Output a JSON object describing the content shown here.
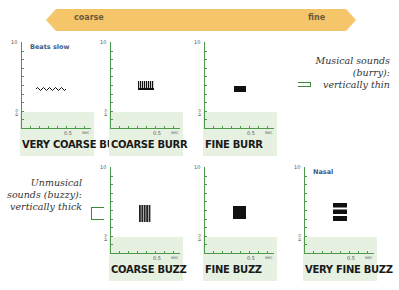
{
  "scale_arrow": {
    "left_label": "coarse",
    "right_label": "fine",
    "color": "#f5c56a"
  },
  "panels": [
    {
      "title": "VERY COARSE BURR",
      "subtitle": "Beats slow",
      "y_top": "10",
      "y_unit": "kHz",
      "x_tick": "0.5",
      "x_unit": "sec",
      "glyph": "wave"
    },
    {
      "title": "COARSE BURR",
      "subtitle": "",
      "y_top": "10",
      "y_unit": "kHz",
      "x_tick": "0.5",
      "x_unit": "sec",
      "glyph": "comb"
    },
    {
      "title": "FINE BURR",
      "subtitle": "",
      "y_top": "10",
      "y_unit": "kHz",
      "x_tick": "0.5",
      "x_unit": "sec",
      "glyph": "bar-thin"
    },
    {
      "title": "COARSE BUZZ",
      "subtitle": "",
      "y_top": "10",
      "y_unit": "kHz",
      "x_tick": "0.5",
      "x_unit": "sec",
      "glyph": "striped-block"
    },
    {
      "title": "FINE BUZZ",
      "subtitle": "",
      "y_top": "10",
      "y_unit": "kHz",
      "x_tick": "0.5",
      "x_unit": "sec",
      "glyph": "solid-block"
    },
    {
      "title": "VERY FINE BUZZ",
      "subtitle": "Nasal",
      "y_top": "10",
      "y_unit": "kHz",
      "x_tick": "0.5",
      "x_unit": "sec",
      "glyph": "horizontal-bands"
    }
  ],
  "notes": {
    "musical": {
      "line1": "Musical sounds",
      "line2": "(burry):",
      "line3": "vertically thin"
    },
    "unmusical": {
      "line1": "Unmusical",
      "line2": "sounds (buzzy):",
      "line3": "vertically thick"
    }
  },
  "colors": {
    "axis": "#4a9a4a",
    "band": "#e6f1e1",
    "subtitle": "#3e5a8a"
  }
}
